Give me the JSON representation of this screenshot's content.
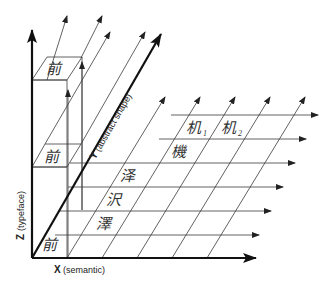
{
  "diagram": {
    "type": "3d-axes-grid",
    "axes": {
      "x": {
        "letter": "X",
        "label": "(semantic)"
      },
      "y": {
        "letter": "Y",
        "label": "(abstract shape)"
      },
      "z": {
        "letter": "Z",
        "label": "(typeface)"
      }
    },
    "glyphs": {
      "top_box": "前",
      "mid_box": "前",
      "origin": "前",
      "ze_simplified": "泽",
      "ze_japanese": "沢",
      "ze_traditional": "澤",
      "ji_1": "机",
      "ji_1_sub": "1",
      "ji_2": "机",
      "ji_2_sub": "2",
      "ji_traditional": "機"
    },
    "colors": {
      "line": "#3a3a3a",
      "axis": "#111111",
      "background": "#ffffff"
    }
  }
}
